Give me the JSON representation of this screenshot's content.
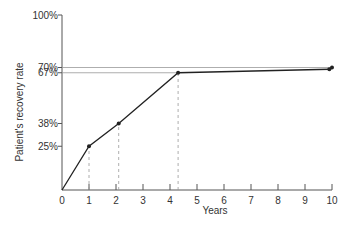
{
  "chart_data": {
    "type": "line",
    "title": "",
    "xlabel": "Years",
    "ylabel": "Patient's recovery rate",
    "xlim": [
      0,
      10
    ],
    "ylim": [
      0,
      100
    ],
    "x_ticks": [
      "0",
      "1",
      "2",
      "3",
      "4",
      "5",
      "6",
      "7",
      "8",
      "9",
      "10"
    ],
    "y_tick_labels": [
      {
        "value": 100,
        "label": "100%"
      },
      {
        "value": 70,
        "label": "70%"
      },
      {
        "value": 67,
        "label": "67%"
      },
      {
        "value": 38,
        "label": "38%"
      },
      {
        "value": 25,
        "label": "25%"
      }
    ],
    "grid": false,
    "series": [
      {
        "name": "Recovery rate",
        "x": [
          0,
          1,
          2.1,
          4.3,
          9.9
        ],
        "y": [
          0,
          25,
          38,
          67,
          69
        ],
        "markers": [
          false,
          true,
          true,
          true,
          true
        ]
      }
    ],
    "reference_lines": [
      {
        "type": "horizontal",
        "y": 70,
        "x_end": 10,
        "end_marker": true
      },
      {
        "type": "horizontal",
        "y": 67,
        "x_end": 4.3
      },
      {
        "type": "vertical_dashed",
        "x": 1,
        "y_end": 25
      },
      {
        "type": "vertical_dashed",
        "x": 2.1,
        "y_end": 38
      },
      {
        "type": "vertical_dashed",
        "x": 4.3,
        "y_end": 67
      }
    ]
  },
  "colors": {
    "line": "#222222",
    "axis": "#555555",
    "ref": "#999999"
  }
}
